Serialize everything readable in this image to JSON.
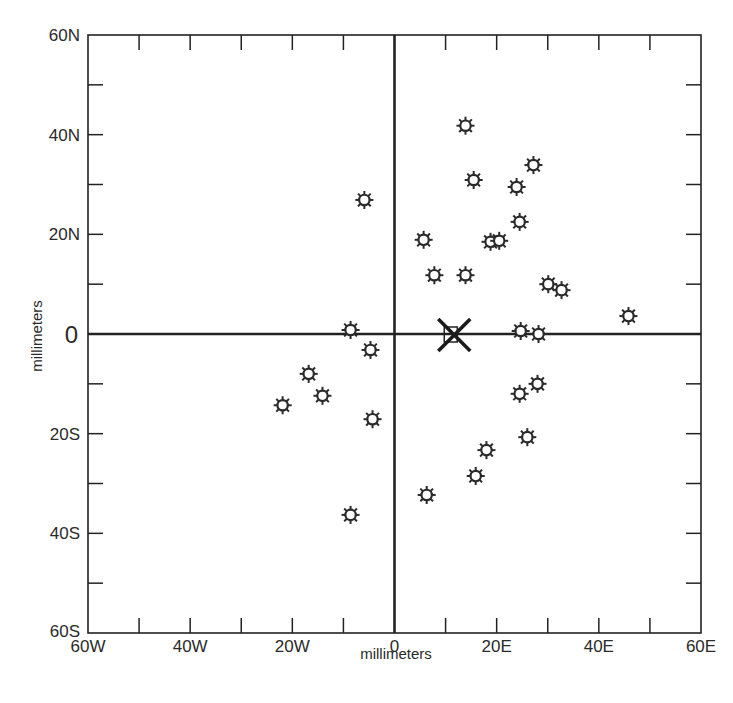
{
  "chart_data": {
    "type": "scatter",
    "title": "",
    "xlabel": "millimeters",
    "ylabel": "millimeters",
    "xlim": [
      -60,
      60
    ],
    "ylim": [
      -60,
      60
    ],
    "grid": false,
    "legend": null,
    "x_ticks": [
      {
        "value": -60,
        "label": "60W"
      },
      {
        "value": -40,
        "label": "40W"
      },
      {
        "value": -20,
        "label": "20W"
      },
      {
        "value": 0,
        "label": "0"
      },
      {
        "value": 20,
        "label": "20E"
      },
      {
        "value": 40,
        "label": "40E"
      },
      {
        "value": 60,
        "label": "60E"
      }
    ],
    "y_ticks": [
      {
        "value": 60,
        "label": "60N"
      },
      {
        "value": 40,
        "label": "40N"
      },
      {
        "value": 20,
        "label": "20N"
      },
      {
        "value": 0,
        "label": "0"
      },
      {
        "value": -20,
        "label": "20S"
      },
      {
        "value": -40,
        "label": "40S"
      },
      {
        "value": -60,
        "label": "60S"
      }
    ],
    "minor_tick_step": 10,
    "series": [
      {
        "name": "points",
        "marker": "sun-star",
        "points": [
          [
            13.9,
            41.8
          ],
          [
            15.5,
            30.9
          ],
          [
            27.2,
            33.9
          ],
          [
            23.9,
            29.5
          ],
          [
            -5.9,
            26.9
          ],
          [
            24.5,
            22.5
          ],
          [
            5.7,
            18.9
          ],
          [
            18.8,
            18.5
          ],
          [
            20.5,
            18.7
          ],
          [
            7.8,
            11.8
          ],
          [
            13.9,
            11.8
          ],
          [
            30.1,
            10.0
          ],
          [
            32.7,
            8.8
          ],
          [
            45.8,
            3.6
          ],
          [
            -8.6,
            0.8
          ],
          [
            24.7,
            0.6
          ],
          [
            28.2,
            0.0
          ],
          [
            -4.7,
            -3.2
          ],
          [
            -16.8,
            -8.0
          ],
          [
            -14.1,
            -12.4
          ],
          [
            -21.9,
            -14.3
          ],
          [
            -4.3,
            -17.1
          ],
          [
            28.0,
            -10.0
          ],
          [
            24.5,
            -12.0
          ],
          [
            26.0,
            -20.7
          ],
          [
            18.0,
            -23.3
          ],
          [
            15.9,
            -28.5
          ],
          [
            6.3,
            -32.3
          ],
          [
            -8.6,
            -36.3
          ]
        ]
      },
      {
        "name": "mean",
        "marker": "x-cross-with-square",
        "points": [
          [
            11.7,
            -0.2
          ]
        ]
      }
    ],
    "colors": {
      "axis": "#222222",
      "marker_stroke": "#2a2a2a",
      "marker_fill": "#ffffff",
      "background": "#ffffff"
    }
  }
}
